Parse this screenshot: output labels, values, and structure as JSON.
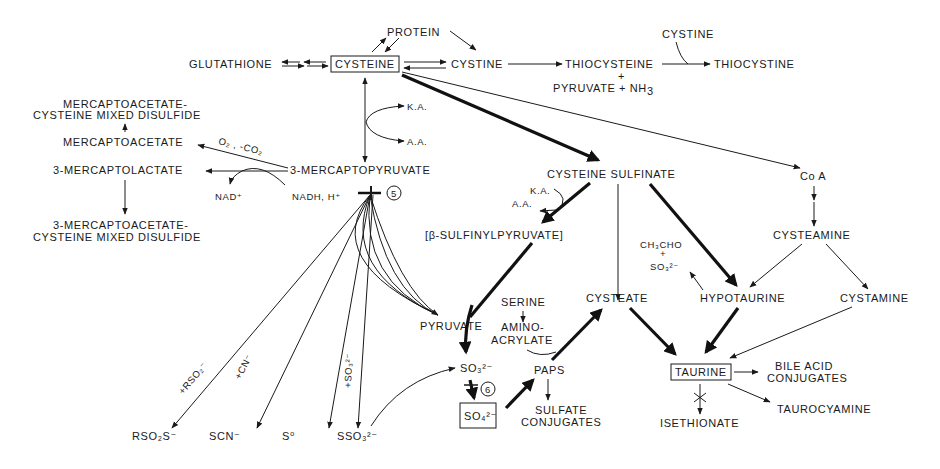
{
  "diagram": {
    "type": "metabolic-pathway",
    "nodes": {
      "cysteine": "CYSTEINE",
      "protein": "PROTEIN",
      "glutathione": "GLUTATHIONE",
      "cystine": "CYSTINE",
      "thiocysteine": "THIOCYSTEINE",
      "thiocysteine_plus": "+",
      "pyruvate_nh3": "PYRUVATE + NH",
      "pyruvate_nh3_sub": "3",
      "cystine_cofactor": "CYSTINE",
      "thiocystine": "THIOCYSTINE",
      "mercaptoacetate_mixed_1": "MERCAPTOACETATE-",
      "mercaptoacetate_mixed_2": "CYSTEINE MIXED DISULFIDE",
      "mercaptoacetate": "MERCAPTOACETATE",
      "o2_co2": "O₂ , -CO₂",
      "mercaptolactate": "3-MERCAPTOLACTATE",
      "mercaptopyruvate": "3-MERCAPTOPYRUVATE",
      "nad": "NAD⁺",
      "nadh": "NADH, H⁺",
      "mercaptoacetate_cys_mixed_1": "3-MERCAPTOACETATE-",
      "mercaptoacetate_cys_mixed_2": "CYSTEINE MIXED DISULFIDE",
      "ka_1": "K.A.",
      "aa_1": "A.A.",
      "enzyme_5": "5",
      "cysteine_sulfinate": "CYSTEINE  SULFINATE",
      "ka_2": "K.A.",
      "aa_2": "A.A.",
      "sulfinylpyruvate": "[β-SULFINYLPYRUVATE]",
      "coa": "Co A",
      "cysteamine": "CYSTEAMINE",
      "ch3cho": "CH₃CHO",
      "ch3cho_plus": "+",
      "so3_small": "SO₃²⁻",
      "cysteate": "CYSTEATE",
      "hypotaurine": "HYPOTAURINE",
      "cystamine": "CYSTAMINE",
      "serine": "SERINE",
      "aminoacrylate_1": "AMINO-",
      "aminoacrylate_2": "ACRYLATE",
      "pyruvate": "PYRUVATE",
      "sulfite": "SO₃²⁻",
      "enzyme_6": "6",
      "sulfate": "SO₄²⁻",
      "paps": "PAPS",
      "sulfate_conj_1": "SULFATE",
      "sulfate_conj_2": "CONJUGATES",
      "taurine": "TAURINE",
      "bile_acid_1": "BILE  ACID",
      "bile_acid_2": "CONJUGATES",
      "taurocyamine": "TAUROCYAMINE",
      "isethionate": "ISETHIONATE",
      "rso2s": "RSO₂S⁻",
      "scn": "SCN⁻",
      "s0": "S⁰",
      "sso3": "SSO₃²⁻",
      "plus_rso2": "+RSO₂⁻",
      "plus_cn": "+CN⁻",
      "plus_so3": "+SO₃²⁻"
    }
  }
}
